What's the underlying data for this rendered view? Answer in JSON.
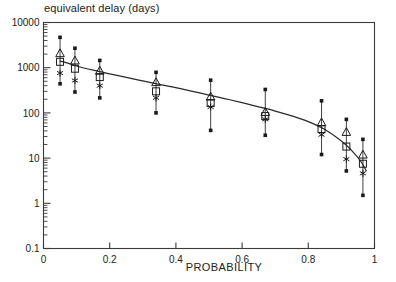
{
  "figure": {
    "title": "equivalent delay (days)",
    "xlabel": "PROBABILITY"
  },
  "chart_data": {
    "type": "scatter",
    "title": "equivalent delay (days)",
    "xlabel": "PROBABILITY",
    "ylabel": "equivalent delay (days)",
    "yscale": "log",
    "xscale": "linear",
    "xlim": [
      0,
      1
    ],
    "ylim": [
      0.1,
      10000
    ],
    "grid": false,
    "legend": "none",
    "xticks": [
      "0",
      "0.2",
      "0.4",
      "0.6",
      "0.8",
      "1"
    ],
    "xtick_values": [
      0,
      0.2,
      0.4,
      0.6,
      0.8,
      1
    ],
    "yticks": [
      "10000",
      "1000",
      "100",
      "10",
      "1",
      "0.1"
    ],
    "ytick_values": [
      10000,
      1000,
      100,
      10,
      1,
      0.1
    ],
    "minor_ticks": true,
    "x": [
      0.05,
      0.095,
      0.17,
      0.34,
      0.505,
      0.67,
      0.84,
      0.915,
      0.965
    ],
    "series": [
      {
        "name": "triangle",
        "marker": "triangle-up",
        "values": [
          2100,
          1450,
          860,
          480,
          230,
          105,
          62,
          38,
          12
        ]
      },
      {
        "name": "square",
        "marker": "square-open",
        "values": [
          1350,
          950,
          620,
          300,
          165,
          85,
          44,
          18,
          7.5
        ]
      },
      {
        "name": "asterisk",
        "marker": "asterisk",
        "values": [
          760,
          520,
          400,
          215,
          135,
          72,
          33,
          9.5,
          4.6
        ]
      }
    ],
    "error_bars": [
      {
        "x": 0.05,
        "low": 440,
        "high": 4700
      },
      {
        "x": 0.095,
        "low": 290,
        "high": 2700
      },
      {
        "x": 0.17,
        "low": 215,
        "high": 1450
      },
      {
        "x": 0.34,
        "low": 100,
        "high": 790
      },
      {
        "x": 0.505,
        "low": 41,
        "high": 530
      },
      {
        "x": 0.67,
        "low": 32,
        "high": 330
      },
      {
        "x": 0.84,
        "low": 12,
        "high": 185
      },
      {
        "x": 0.915,
        "low": 5.2,
        "high": 72
      },
      {
        "x": 0.965,
        "low": 1.5,
        "high": 26
      }
    ],
    "fit_curve": {
      "name": "fitted model curve",
      "x": [
        0.05,
        0.1,
        0.15,
        0.2,
        0.25,
        0.3,
        0.35,
        0.4,
        0.45,
        0.5,
        0.55,
        0.6,
        0.65,
        0.7,
        0.75,
        0.8,
        0.85,
        0.9,
        0.93,
        0.96,
        0.975
      ],
      "y": [
        1420,
        1090,
        880,
        730,
        610,
        510,
        430,
        362,
        300,
        248,
        205,
        168,
        136,
        110,
        86,
        64,
        43,
        24,
        15,
        8.2,
        5.2
      ]
    }
  }
}
